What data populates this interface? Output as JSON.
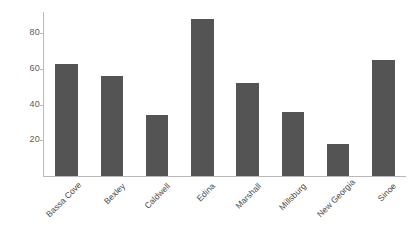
{
  "chart_data": {
    "type": "bar",
    "title": "",
    "subtitle": "",
    "xlabel": "",
    "ylabel": "",
    "categories": [
      "Bassa Cove",
      "Bexley",
      "Caldwell",
      "Edina",
      "Marshall",
      "Millsburg",
      "New Georgia",
      "Sinoe"
    ],
    "values": [
      63,
      56,
      34,
      88,
      52,
      36,
      18,
      65
    ],
    "yticks": [
      20,
      40,
      60,
      80
    ],
    "ylim": [
      0,
      92
    ],
    "grid": false,
    "legend": false,
    "legend_position": "none",
    "bar_color": "#545454",
    "axis_color": "#b9b9b9",
    "tick_label_color": "#5b5b5b",
    "category_label_color": "#4a4a4a",
    "background": "#ffffff",
    "category_label_rotation": -45
  }
}
